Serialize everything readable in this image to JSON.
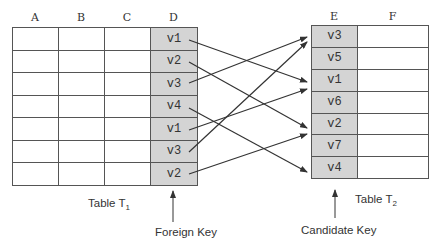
{
  "table1": {
    "columns": [
      "A",
      "B",
      "C",
      "D"
    ],
    "key_column": "D",
    "key_values": [
      "v1",
      "v2",
      "v3",
      "v4",
      "v1",
      "v3",
      "v2"
    ],
    "label": "Table T",
    "label_sub": "1",
    "pointer_label": "Foreign Key"
  },
  "table2": {
    "columns": [
      "E",
      "F"
    ],
    "key_column": "E",
    "key_values": [
      "v3",
      "v5",
      "v1",
      "v6",
      "v2",
      "v7",
      "v4"
    ],
    "label": "Table T",
    "label_sub": "2",
    "pointer_label": "Candidate Key"
  },
  "mappings": [
    {
      "from_row": 0,
      "value": "v1",
      "to_row": 2
    },
    {
      "from_row": 1,
      "value": "v2",
      "to_row": 4
    },
    {
      "from_row": 2,
      "value": "v3",
      "to_row": 0
    },
    {
      "from_row": 3,
      "value": "v4",
      "to_row": 6
    },
    {
      "from_row": 4,
      "value": "v1",
      "to_row": 2
    },
    {
      "from_row": 5,
      "value": "v3",
      "to_row": 0
    },
    {
      "from_row": 6,
      "value": "v2",
      "to_row": 4
    }
  ],
  "colors": {
    "key_fill": "#d4d4d4",
    "line": "#333333"
  }
}
